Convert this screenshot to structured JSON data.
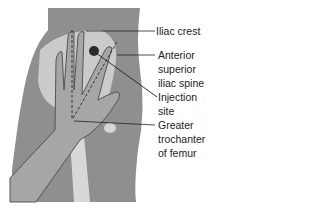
{
  "figure": {
    "colors": {
      "skin": "#8f8f8f",
      "bone": "#d8d8d8",
      "hand": "#a8a8a8",
      "outline": "#3a3a3a",
      "site": "#2b2b2b",
      "background": "#ffffff"
    },
    "labels": {
      "iliac_crest": "Iliac crest",
      "asis_1": "Anterior",
      "asis_2": "superior",
      "asis_3": "iliac spine",
      "injection_1": "Injection",
      "injection_2": "site",
      "trochanter_1": "Greater",
      "trochanter_2": "trochanter",
      "trochanter_3": "of femur"
    }
  }
}
